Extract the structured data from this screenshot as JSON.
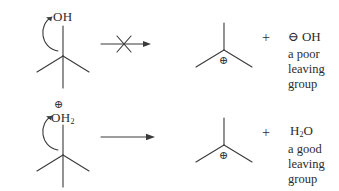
{
  "diagram": {
    "ink_color": "#2b2b2b",
    "rows": [
      {
        "id": "row-poor-leaving-group",
        "reactant": {
          "name": "tert-butyl alcohol",
          "skeleton": "tert-butyl",
          "heteroatom_label": "OH",
          "heteroatom_charge": "",
          "curved_arrow": "C-O bond heterolysis arrow"
        },
        "arrow": {
          "type": "blocked",
          "glyph": "crossed-reaction-arrow",
          "meaning": "reaction does not occur"
        },
        "products": {
          "cation": {
            "name": "tert-butyl cation",
            "skeleton": "tert-butyl-cation",
            "charge": "⊕"
          },
          "separator": "+",
          "species_charge": "⊖",
          "species_formula": "OH",
          "caption_lines": [
            "a poor",
            "leaving",
            "group"
          ]
        }
      },
      {
        "id": "row-good-leaving-group",
        "reactant": {
          "name": "protonated tert-butyl alcohol",
          "skeleton": "tert-butyl",
          "heteroatom_label": "OH",
          "heteroatom_subscript": "2",
          "heteroatom_charge": "⊕",
          "curved_arrow": "C-O bond heterolysis arrow"
        },
        "arrow": {
          "type": "forward",
          "glyph": "reaction-arrow",
          "meaning": "reaction proceeds"
        },
        "products": {
          "cation": {
            "name": "tert-butyl cation",
            "skeleton": "tert-butyl-cation",
            "charge": "⊕"
          },
          "separator": "+",
          "species_charge": "",
          "species_formula": "H",
          "species_subscript": "2",
          "species_formula_tail": "O",
          "caption_lines": [
            "a good",
            "leaving",
            "group"
          ]
        }
      }
    ]
  }
}
